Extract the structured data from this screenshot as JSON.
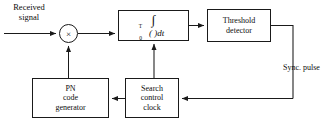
{
  "diagram": {
    "labels": {
      "received_signal_line1": "Received",
      "received_signal_line2": "signal",
      "sync_pulse_line1": "Sync.",
      "sync_pulse_line2": "pulse"
    },
    "blocks": [
      {
        "id": "multiplier",
        "type": "mixer",
        "symbol": "×",
        "label": "×"
      },
      {
        "id": "integrator",
        "type": "process",
        "integral_symbol": "∫",
        "lower_limit": "0",
        "upper_limit": "T",
        "operand": "( )",
        "differential": "dt"
      },
      {
        "id": "threshold_detector",
        "type": "process",
        "line1": "Threshold",
        "line2": "detector"
      },
      {
        "id": "pn_code_generator",
        "type": "process",
        "line1": "PN",
        "line2": "code",
        "line3": "generator"
      },
      {
        "id": "search_control_clock",
        "type": "process",
        "line1": "Search",
        "line2": "control",
        "line3": "clock"
      }
    ],
    "colors": {
      "line": "#1a1a1a",
      "text": "#0d0d0d",
      "background": "#ffffff"
    }
  }
}
